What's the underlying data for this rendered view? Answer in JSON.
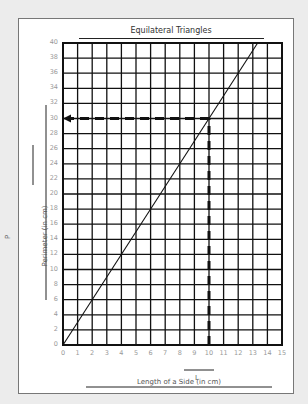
{
  "chart_data": {
    "type": "line",
    "title": "Equilateral Triangles",
    "xlabel": "Length of a Side (in cm)",
    "xvar": "L",
    "ylabel": "Perimeter (in cm)",
    "yvar": "P",
    "xlim": [
      0,
      15
    ],
    "ylim": [
      0,
      40
    ],
    "grid": true,
    "x_ticks": [
      0,
      1,
      2,
      3,
      4,
      5,
      6,
      7,
      8,
      9,
      10,
      11,
      12,
      13,
      14,
      15
    ],
    "y_ticks": [
      0,
      2,
      4,
      6,
      8,
      10,
      12,
      14,
      16,
      18,
      20,
      22,
      24,
      26,
      28,
      30,
      32,
      34,
      36,
      38,
      40
    ],
    "series": [
      {
        "name": "P = 3L",
        "x": [
          0,
          13.33
        ],
        "y": [
          0,
          40
        ]
      }
    ],
    "annotations": [
      {
        "type": "dashed-arrow",
        "description": "Vertical dashed line from L=10 up to the line at P=30, then horizontal dashed arrow left to the y-axis at 30",
        "x": 10,
        "y": 30
      }
    ]
  }
}
